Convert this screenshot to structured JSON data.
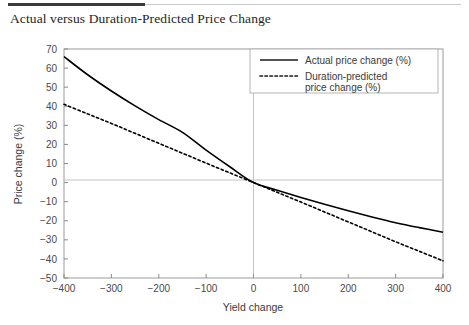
{
  "figure": {
    "title": "Actual versus Duration-Predicted Price Change"
  },
  "chart_data": {
    "type": "line",
    "title": "Actual versus Duration-Predicted Price Change",
    "xlabel": "Yield change",
    "ylabel": "Price change (%)",
    "xlim": [
      -400,
      400
    ],
    "ylim": [
      -50,
      70
    ],
    "xticks": [
      -400,
      -300,
      -200,
      -100,
      0,
      100,
      200,
      300,
      400
    ],
    "xticklabels": [
      "−400",
      "−300",
      "−200",
      "−100",
      "0",
      "100",
      "200",
      "300",
      "400"
    ],
    "yticks": [
      -50,
      -40,
      -30,
      -20,
      -10,
      0,
      10,
      20,
      30,
      40,
      50,
      60,
      70
    ],
    "yticklabels": [
      "−50",
      "−40",
      "−30",
      "−20",
      "−10",
      "0",
      "10",
      "20",
      "30",
      "40",
      "50",
      "60",
      "70"
    ],
    "grid": false,
    "zero_lines": true,
    "legend_position": "upper right",
    "x": [
      -400,
      -350,
      -300,
      -250,
      -200,
      -150,
      -100,
      -50,
      0,
      50,
      100,
      150,
      200,
      250,
      300,
      350,
      400
    ],
    "series": [
      {
        "name": "Actual price change (%)",
        "style": "solid",
        "color": "#000000",
        "values": [
          66.0,
          56.5,
          48.0,
          40.2,
          33.0,
          26.3,
          17.0,
          8.3,
          0.0,
          -4.0,
          -7.8,
          -11.4,
          -14.8,
          -18.0,
          -21.0,
          -23.6,
          -26.0
        ]
      },
      {
        "name": "Duration-predicted price change (%)",
        "style": "dotted",
        "color": "#000000",
        "values": [
          41.0,
          36.0,
          31.0,
          25.8,
          20.6,
          15.4,
          10.2,
          5.1,
          0.0,
          -5.1,
          -10.2,
          -15.4,
          -20.6,
          -25.8,
          -31.0,
          -36.0,
          -41.0
        ]
      }
    ]
  },
  "legend": {
    "entries": [
      {
        "label": "Actual price change (%)",
        "style": "solid"
      },
      {
        "label_line1": "Duration-predicted",
        "label_line2": "price change (%)",
        "style": "dotted"
      }
    ]
  },
  "colors": {
    "axis": "#8a8a8a",
    "zero_line": "#bdbdbd",
    "curve": "#1a1a1a",
    "title_rule": "#3a3a3a",
    "text": "#3a3a3a"
  }
}
